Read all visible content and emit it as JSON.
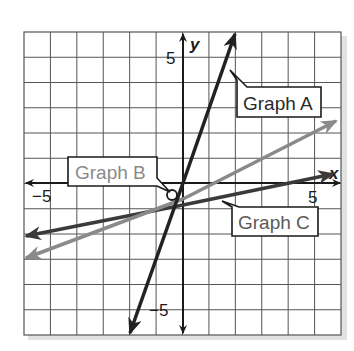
{
  "chart_data": {
    "type": "line",
    "title": "",
    "xlabel": "x",
    "ylabel": "y",
    "xlim": [
      -6,
      6
    ],
    "ylim": [
      -6,
      6
    ],
    "grid": true,
    "x_tick_labels": [
      {
        "value": -5,
        "label": "−5"
      },
      {
        "value": 5,
        "label": "5"
      }
    ],
    "y_tick_labels": [
      {
        "value": 5,
        "label": "5"
      },
      {
        "value": -5,
        "label": "−5"
      }
    ],
    "series": [
      {
        "name": "Graph A",
        "equation": "y = 3x",
        "color": "#222222",
        "points": [
          [
            -2,
            -6
          ],
          [
            2,
            6
          ]
        ]
      },
      {
        "name": "Graph B",
        "equation": "y ≈ 0.5x − 0.5",
        "color": "#8a8a8a",
        "points": [
          [
            -6,
            -3
          ],
          [
            6,
            2.5
          ]
        ]
      },
      {
        "name": "Graph C",
        "equation": "y ≈ 0.2x − 0.8",
        "color": "#3a3a3a",
        "points": [
          [
            -6,
            -2
          ],
          [
            6,
            0.5
          ]
        ]
      }
    ],
    "annotations": [
      {
        "text": "Graph A",
        "target_series": "Graph A"
      },
      {
        "text": "Graph B",
        "target_series": "Graph B"
      },
      {
        "text": "Graph C",
        "target_series": "Graph C"
      }
    ]
  },
  "labels": {
    "x_axis": "x",
    "y_axis": "y",
    "x_neg5": "−5",
    "x_pos5": "5",
    "y_pos5": "5",
    "y_neg5": "−5",
    "graph_a": "Graph A",
    "graph_b": "Graph B",
    "graph_c": "Graph C"
  },
  "colors": {
    "graph_a": "#222222",
    "graph_b": "#8a8a8a",
    "graph_c": "#3a3a3a",
    "grid": "#555555",
    "axis": "#1a1a1a"
  }
}
